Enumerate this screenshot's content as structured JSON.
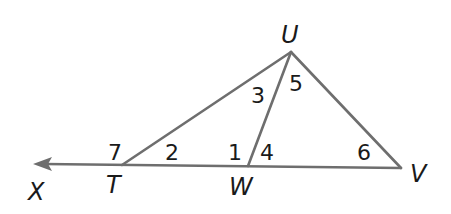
{
  "diagram": {
    "type": "geometry-triangle",
    "points": {
      "U": {
        "label": "U",
        "x": 291,
        "y": 52
      },
      "T": {
        "label": "T",
        "x": 122,
        "y": 165
      },
      "W": {
        "label": "W",
        "x": 248,
        "y": 166
      },
      "V": {
        "label": "V",
        "x": 401,
        "y": 168
      },
      "X": {
        "label": "X",
        "x": 33,
        "y": 164
      }
    },
    "segments": [
      "UT",
      "UW",
      "UV",
      "TV",
      "ray TX"
    ],
    "angle_labels": {
      "a1": "1",
      "a2": "2",
      "a3": "3",
      "a4": "4",
      "a5": "5",
      "a6": "6",
      "a7": "7"
    },
    "colors": {
      "line": "#6e6e6e",
      "text": "#1a1a1a",
      "background": "#ffffff"
    }
  }
}
